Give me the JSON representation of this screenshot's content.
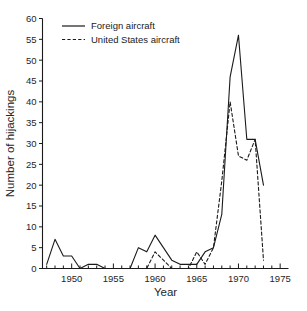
{
  "chart_data": {
    "type": "line",
    "title": "",
    "xlabel": "Year",
    "ylabel": "Number of hijackings",
    "xlim": [
      1946.5,
      1976
    ],
    "ylim": [
      0,
      60
    ],
    "grid": false,
    "legend_position": "top-left-inside",
    "x_ticks_major": [
      1950,
      1955,
      1960,
      1965,
      1970,
      1975
    ],
    "x_tick_labels": [
      "1950",
      "1955",
      "1960",
      "1965",
      "1970",
      "1975"
    ],
    "x_ticks_minor_step": 1,
    "y_ticks": [
      0,
      5,
      10,
      15,
      20,
      25,
      30,
      35,
      40,
      45,
      50,
      55,
      60
    ],
    "y_tick_labels": [
      "0",
      "5",
      "10",
      "15",
      "20",
      "25",
      "30",
      "35",
      "40",
      "45",
      "50",
      "55",
      "60"
    ],
    "x": [
      1947,
      1948,
      1949,
      1950,
      1951,
      1952,
      1953,
      1954,
      1955,
      1956,
      1957,
      1958,
      1959,
      1960,
      1961,
      1962,
      1963,
      1964,
      1965,
      1966,
      1967,
      1968,
      1969,
      1970,
      1971,
      1972,
      1973
    ],
    "series": [
      {
        "name": "Foreign aircraft",
        "style": "solid",
        "values": [
          1,
          7,
          3,
          3,
          0,
          1,
          1,
          0,
          0,
          0,
          0,
          5,
          4,
          8,
          5,
          2,
          1,
          1,
          1,
          4,
          5,
          13,
          46,
          56,
          31,
          31,
          20
        ]
      },
      {
        "name": "United States aircraft",
        "style": "dashed",
        "values": [
          0,
          0,
          0,
          0,
          0,
          0,
          0,
          0,
          0,
          0,
          0,
          0,
          0,
          4,
          2,
          0,
          0,
          0,
          4,
          1,
          5,
          21,
          40,
          27,
          26,
          31,
          2
        ]
      }
    ]
  },
  "legend": {
    "entries": [
      {
        "label": "Foreign aircraft",
        "style": "solid"
      },
      {
        "label": "United States aircraft",
        "style": "dashed"
      }
    ]
  }
}
